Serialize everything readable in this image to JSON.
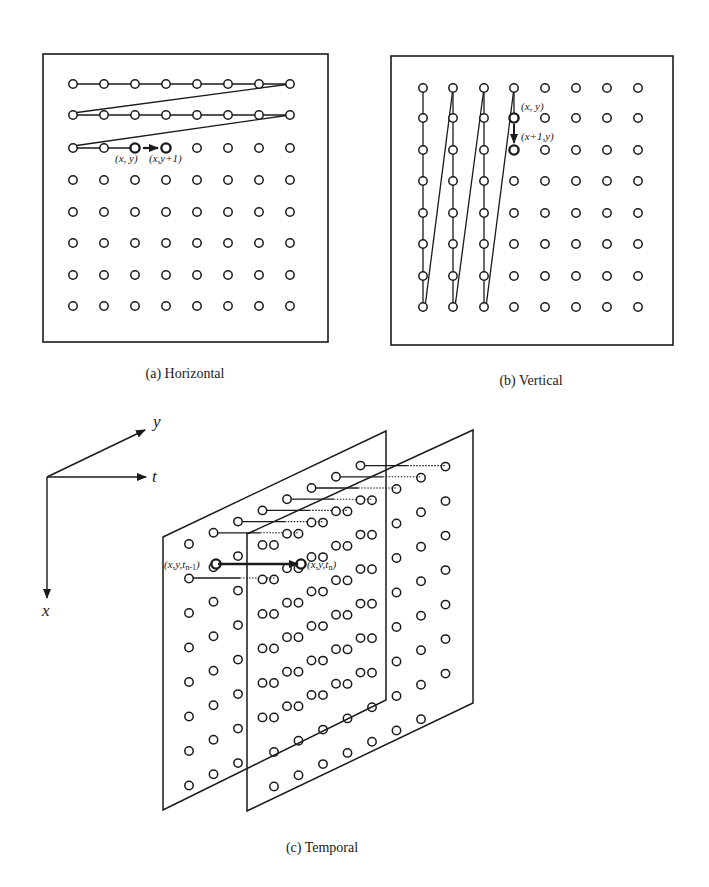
{
  "figure": {
    "colors": {
      "ink": "#1a1a1a",
      "background": "#ffffff"
    },
    "panels": [
      {
        "id": "a",
        "caption": "(a) Horizontal",
        "scan_order": "row-by-row, left to right",
        "grid": {
          "rows": 8,
          "cols": 8
        },
        "scanned_rows": 2,
        "current_row_scanned_cols": 3,
        "labels": {
          "current": "(x, y)",
          "next": "(x,y+1)"
        }
      },
      {
        "id": "b",
        "caption": "(b) Vertical",
        "scan_order": "column-by-column, top to bottom",
        "grid": {
          "rows": 8,
          "cols": 8
        },
        "scanned_cols": 3,
        "current_col_scanned_rows": 2,
        "labels": {
          "current": "(x, y)",
          "next": "(x+1,y)"
        }
      },
      {
        "id": "c",
        "caption": "(c) Temporal",
        "scan_order": "same pixel across consecutive frames",
        "frames": 2,
        "axes": {
          "x": "x",
          "y": "y",
          "t": "t"
        },
        "labels": {
          "previous": "(x,y,t",
          "previous_sub": "n-1",
          "current": "(x,y,t",
          "current_sub": "n"
        }
      }
    ]
  }
}
